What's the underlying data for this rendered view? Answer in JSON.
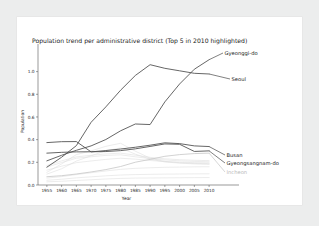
{
  "figure": {
    "background_color": "#eceded",
    "card_color": "#ffffff"
  },
  "chart_data": {
    "type": "line",
    "title": "Population trend per administrative district (Top 5 in 2010 highlighted)",
    "xlabel": "Year",
    "ylabel": "Population",
    "xlim": [
      1952,
      2012
    ],
    "ylim": [
      0.0,
      1.12
    ],
    "grid": false,
    "legend_position": "right-inline-labels",
    "x_tick_labels": [
      "1955",
      "1960",
      "1965",
      "1970",
      "1975",
      "1980",
      "1985",
      "1990",
      "1995",
      "2000",
      "2005",
      "2010"
    ],
    "x": [
      1955,
      1960,
      1965,
      1970,
      1975,
      1980,
      1985,
      1990,
      1995,
      2000,
      2005,
      2010
    ],
    "y_tick_labels": [
      "0.0",
      "0.2",
      "0.4",
      "0.6",
      "0.8",
      "1.0"
    ],
    "y_ticks": [
      0.0,
      0.2,
      0.4,
      0.6,
      0.8,
      1.0
    ],
    "highlight_color": "#4a4a4a",
    "background_series_color": "#dcdcdc",
    "series": [
      {
        "name": "Seoul",
        "label": "Seoul",
        "highlighted": true,
        "color": "#4a4a4a",
        "values": [
          0.157,
          0.245,
          0.347,
          0.553,
          0.689,
          0.836,
          0.966,
          1.061,
          1.029,
          1.007,
          0.985,
          0.979
        ]
      },
      {
        "name": "Gyeonggi-do",
        "label": "Gyeonggi-do",
        "highlighted": true,
        "color": "#4a4a4a",
        "values": [
          0.213,
          0.262,
          0.306,
          0.345,
          0.401,
          0.478,
          0.538,
          0.533,
          0.733,
          0.891,
          1.021,
          1.105
        ]
      },
      {
        "name": "Busan",
        "label": "Busan",
        "highlighted": true,
        "color": "#4a4a4a",
        "values": [
          0.374,
          0.382,
          0.383,
          0.292,
          0.304,
          0.317,
          0.333,
          0.351,
          0.372,
          0.365,
          0.345,
          0.339
        ]
      },
      {
        "name": "Gyeongsangnam-do",
        "label": "Gyeongsangnam-do",
        "highlighted": true,
        "color": "#4a4a4a",
        "values": [
          0.281,
          0.288,
          0.292,
          0.293,
          0.295,
          0.303,
          0.319,
          0.34,
          0.362,
          0.359,
          0.296,
          0.301
        ]
      },
      {
        "name": "Incheon",
        "label": "Incheon",
        "highlighted": false,
        "color": "#c6c6c6",
        "values": [
          0.073,
          0.082,
          0.097,
          0.115,
          0.136,
          0.163,
          0.201,
          0.226,
          0.253,
          0.268,
          0.277,
          0.281
        ]
      },
      {
        "name": "bg-1",
        "label": "",
        "highlighted": false,
        "color": "#dcdcdc",
        "values": [
          0.112,
          0.186,
          0.268,
          0.301,
          0.341,
          0.368,
          0.298,
          0.237,
          0.208,
          0.196,
          0.19,
          0.188
        ]
      },
      {
        "name": "bg-2",
        "label": "",
        "highlighted": false,
        "color": "#dcdcdc",
        "values": [
          0.096,
          0.143,
          0.211,
          0.258,
          0.302,
          0.327,
          0.272,
          0.228,
          0.203,
          0.193,
          0.186,
          0.182
        ]
      },
      {
        "name": "bg-3",
        "label": "",
        "highlighted": false,
        "color": "#dcdcdc",
        "values": [
          0.158,
          0.198,
          0.236,
          0.249,
          0.261,
          0.266,
          0.249,
          0.233,
          0.221,
          0.213,
          0.208,
          0.205
        ]
      },
      {
        "name": "bg-4",
        "label": "",
        "highlighted": false,
        "color": "#dcdcdc",
        "values": [
          0.061,
          0.074,
          0.092,
          0.108,
          0.124,
          0.138,
          0.147,
          0.152,
          0.156,
          0.158,
          0.16,
          0.161
        ]
      },
      {
        "name": "bg-5",
        "label": "",
        "highlighted": false,
        "color": "#dcdcdc",
        "values": [
          0.042,
          0.051,
          0.063,
          0.072,
          0.081,
          0.088,
          0.092,
          0.094,
          0.096,
          0.097,
          0.098,
          0.099
        ]
      },
      {
        "name": "bg-6",
        "label": "",
        "highlighted": false,
        "color": "#dcdcdc",
        "values": [
          0.131,
          0.166,
          0.197,
          0.212,
          0.226,
          0.236,
          0.228,
          0.216,
          0.207,
          0.201,
          0.197,
          0.195
        ]
      },
      {
        "name": "bg-7",
        "label": "",
        "highlighted": false,
        "color": "#dcdcdc",
        "values": [
          0.028,
          0.033,
          0.04,
          0.046,
          0.053,
          0.058,
          0.061,
          0.062,
          0.063,
          0.064,
          0.065,
          0.066
        ]
      },
      {
        "name": "bg-8",
        "label": "",
        "highlighted": false,
        "color": "#dcdcdc",
        "values": [
          0.172,
          0.213,
          0.248,
          0.262,
          0.274,
          0.281,
          0.263,
          0.244,
          0.231,
          0.223,
          0.218,
          0.215
        ]
      }
    ]
  }
}
